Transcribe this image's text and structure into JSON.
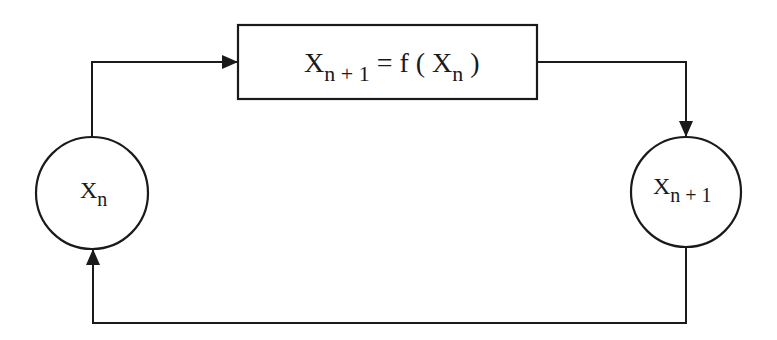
{
  "diagram": {
    "type": "feedback-loop",
    "colors": {
      "stroke": "#1a1a1a",
      "background": "#ffffff"
    },
    "nodes": [
      {
        "id": "xn",
        "shape": "circle",
        "label_base": "X",
        "label_sub": "n"
      },
      {
        "id": "func",
        "shape": "rectangle",
        "label_base": "X",
        "label_sub": "n + 1",
        "label_rest": " = f ( X",
        "label_sub2": "n",
        "label_end": " )"
      },
      {
        "id": "xn1",
        "shape": "circle",
        "label_base": "X",
        "label_sub": "n + 1"
      }
    ],
    "edges": [
      {
        "from": "xn",
        "to": "func",
        "arrow": "end"
      },
      {
        "from": "func",
        "to": "xn1",
        "arrow": "end"
      },
      {
        "from": "xn1",
        "to": "xn",
        "arrow": "end"
      }
    ]
  }
}
